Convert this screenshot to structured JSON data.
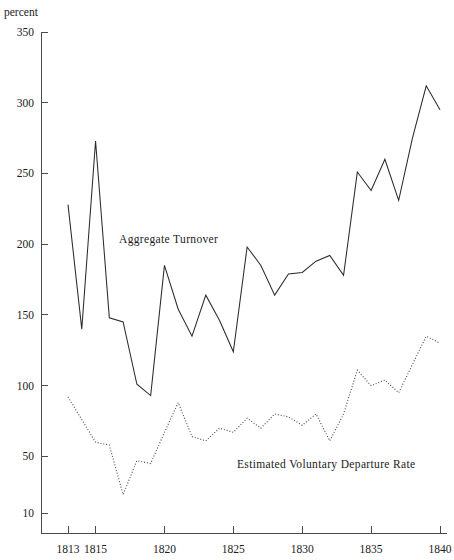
{
  "figure": {
    "background_color": "#ffffff",
    "line_color": "#2b2b2b",
    "axis_color": "#4a4a4a"
  },
  "axis": {
    "unit_label": "percent",
    "y_ticks": [
      "350",
      "300",
      "250",
      "200",
      "150",
      "100",
      "50",
      "10"
    ],
    "x_ticks": [
      "1813",
      "1815",
      "1820",
      "1825",
      "1830",
      "1835",
      "1840"
    ]
  },
  "annotations": {
    "aggregate_turnover": "Aggregate  Turnover",
    "departure_rate": "Estimated  Voluntary  Departure  Rate"
  },
  "chart_data": {
    "type": "line",
    "title": "",
    "xlabel": "",
    "ylabel": "percent",
    "xlim": [
      1813,
      1840
    ],
    "ylim": [
      10,
      350
    ],
    "grid": false,
    "legend": "inline-annotations",
    "x": [
      1813,
      1814,
      1815,
      1816,
      1817,
      1818,
      1819,
      1820,
      1821,
      1822,
      1823,
      1824,
      1825,
      1826,
      1827,
      1828,
      1829,
      1830,
      1831,
      1832,
      1833,
      1834,
      1835,
      1836,
      1837,
      1838,
      1839,
      1840
    ],
    "series": [
      {
        "name": "Aggregate Turnover",
        "style": "solid",
        "values": [
          228,
          140,
          273,
          148,
          145,
          101,
          93,
          185,
          154,
          135,
          164,
          146,
          124,
          198,
          185,
          164,
          179,
          180,
          188,
          192,
          178,
          251,
          238,
          260,
          231,
          275,
          312,
          295
        ]
      },
      {
        "name": "Estimated Voluntary Departure Rate",
        "style": "dotted",
        "values": [
          92,
          76,
          60,
          58,
          23,
          47,
          45,
          67,
          88,
          64,
          61,
          70,
          67,
          77,
          70,
          80,
          78,
          72,
          80,
          61,
          80,
          111,
          100,
          104,
          95,
          115,
          135,
          130
        ]
      }
    ]
  }
}
